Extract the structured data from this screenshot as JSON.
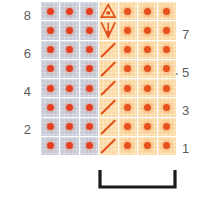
{
  "figure": {
    "title": "",
    "left_axis_labels": [
      "8",
      "6",
      "4",
      "2"
    ],
    "right_axis_labels": [
      "7",
      "5",
      "3",
      "1"
    ],
    "bracket_label": ""
  },
  "colors": {
    "grid_gray": "#c7ccd8",
    "grid_orange": "#fbd9a2",
    "dot_red": "#e8401f",
    "symbol_orange": "#e4501c",
    "bracket_black": "#1a1a1a",
    "label_gray": "#5d5d5d"
  },
  "chart_data": {
    "type": "heatmap",
    "title": "",
    "xlabel": "",
    "ylabel": "",
    "rows": 8,
    "columns": 7,
    "row_labels_left": [
      "8",
      "",
      "6",
      "",
      "4",
      "",
      "2",
      ""
    ],
    "row_labels_right": [
      "",
      "7",
      "",
      "5",
      "",
      "3",
      "",
      "1"
    ],
    "legend": [
      {
        "name": "gray-cell-with-dot",
        "color": "#c7ccd8"
      },
      {
        "name": "orange-cell-with-dot",
        "color": "#fbd9a2"
      },
      {
        "name": "slash-marker",
        "color": "#e4501c"
      },
      {
        "name": "triangle-with-dot-marker",
        "color": "#e4501c"
      },
      {
        "name": "down-arrow-marker",
        "color": "#e4501c"
      }
    ],
    "cells": [
      [
        {
          "fill": "gray",
          "marker": "dot"
        },
        {
          "fill": "gray",
          "marker": "dot"
        },
        {
          "fill": "gray",
          "marker": "dot"
        },
        {
          "fill": "orange",
          "marker": "triangle-dot"
        },
        {
          "fill": "orange",
          "marker": "dot"
        },
        {
          "fill": "orange",
          "marker": "dot"
        },
        {
          "fill": "orange",
          "marker": "dot"
        }
      ],
      [
        {
          "fill": "gray",
          "marker": "dot"
        },
        {
          "fill": "gray",
          "marker": "dot"
        },
        {
          "fill": "gray",
          "marker": "dot"
        },
        {
          "fill": "orange",
          "marker": "down-arrow"
        },
        {
          "fill": "orange",
          "marker": "dot"
        },
        {
          "fill": "orange",
          "marker": "dot"
        },
        {
          "fill": "orange",
          "marker": "dot"
        }
      ],
      [
        {
          "fill": "gray",
          "marker": "dot"
        },
        {
          "fill": "gray",
          "marker": "dot"
        },
        {
          "fill": "gray",
          "marker": "dot"
        },
        {
          "fill": "orange",
          "marker": "slash"
        },
        {
          "fill": "orange",
          "marker": "dot"
        },
        {
          "fill": "orange",
          "marker": "dot"
        },
        {
          "fill": "orange",
          "marker": "dot"
        }
      ],
      [
        {
          "fill": "gray",
          "marker": "dot"
        },
        {
          "fill": "gray",
          "marker": "dot"
        },
        {
          "fill": "gray",
          "marker": "dot"
        },
        {
          "fill": "orange",
          "marker": "slash"
        },
        {
          "fill": "orange",
          "marker": "dot"
        },
        {
          "fill": "orange",
          "marker": "dot"
        },
        {
          "fill": "orange",
          "marker": "dot"
        }
      ],
      [
        {
          "fill": "gray",
          "marker": "dot"
        },
        {
          "fill": "gray",
          "marker": "dot"
        },
        {
          "fill": "gray",
          "marker": "dot"
        },
        {
          "fill": "orange",
          "marker": "slash"
        },
        {
          "fill": "orange",
          "marker": "dot"
        },
        {
          "fill": "orange",
          "marker": "dot"
        },
        {
          "fill": "orange",
          "marker": "dot"
        }
      ],
      [
        {
          "fill": "gray",
          "marker": "dot"
        },
        {
          "fill": "gray",
          "marker": "dot"
        },
        {
          "fill": "gray",
          "marker": "dot"
        },
        {
          "fill": "orange",
          "marker": "slash"
        },
        {
          "fill": "orange",
          "marker": "dot"
        },
        {
          "fill": "orange",
          "marker": "dot"
        },
        {
          "fill": "orange",
          "marker": "dot"
        }
      ],
      [
        {
          "fill": "gray",
          "marker": "dot"
        },
        {
          "fill": "gray",
          "marker": "dot"
        },
        {
          "fill": "gray",
          "marker": "dot"
        },
        {
          "fill": "orange",
          "marker": "slash"
        },
        {
          "fill": "orange",
          "marker": "dot"
        },
        {
          "fill": "orange",
          "marker": "dot"
        },
        {
          "fill": "orange",
          "marker": "dot"
        }
      ],
      [
        {
          "fill": "gray",
          "marker": "dot"
        },
        {
          "fill": "gray",
          "marker": "dot"
        },
        {
          "fill": "gray",
          "marker": "dot"
        },
        {
          "fill": "orange",
          "marker": "slash"
        },
        {
          "fill": "orange",
          "marker": "dot"
        },
        {
          "fill": "orange",
          "marker": "dot"
        },
        {
          "fill": "orange",
          "marker": "dot"
        }
      ]
    ],
    "bracket": {
      "from_column": 4,
      "to_column": 7,
      "position": "bottom"
    }
  }
}
